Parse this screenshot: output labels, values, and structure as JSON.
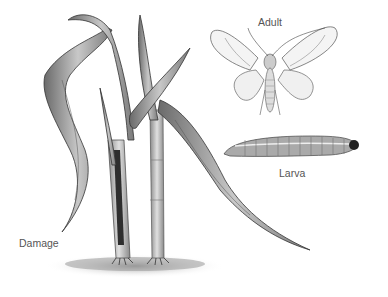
{
  "labels": {
    "adult": "Adult",
    "larva": "Larva",
    "damage": "Damage"
  },
  "colors": {
    "ink": "#3a3a3a",
    "leaf_fill": "#9a9a9a",
    "soil": "#8a8a8a"
  }
}
